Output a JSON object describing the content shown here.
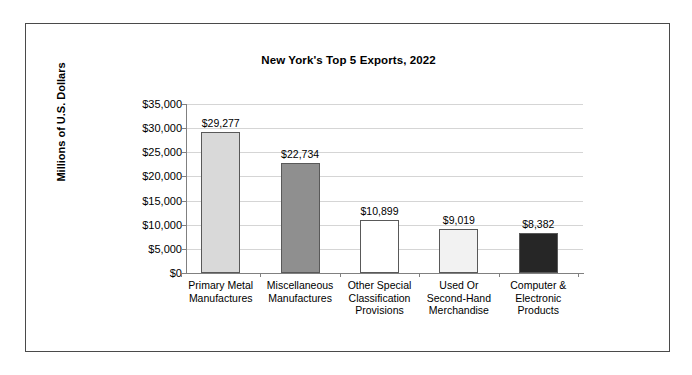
{
  "chart_data": {
    "type": "bar",
    "title": "New York's Top 5 Exports, 2022",
    "xlabel": "",
    "ylabel": "Millions of U.S. Dollars",
    "ylim": [
      0,
      35000
    ],
    "ytick_labels": [
      "$35,000",
      "$30,000",
      "$25,000",
      "$20,000",
      "$15,000",
      "$10,000",
      "$5,000",
      "$0"
    ],
    "ytick_values": [
      35000,
      30000,
      25000,
      20000,
      15000,
      10000,
      5000,
      0
    ],
    "grid": true,
    "legend": "none",
    "categories": [
      "Primary Metal Manufactures",
      "Miscellaneous Manufactures",
      "Other Special Classification Provisions",
      "Used Or Second-Hand Merchandise",
      "Computer & Electronic Products"
    ],
    "category_lines": [
      [
        "Primary Metal",
        "Manufactures"
      ],
      [
        "Miscellaneous",
        "Manufactures"
      ],
      [
        "Other Special",
        "Classification",
        "Provisions"
      ],
      [
        "Used Or",
        "Second-Hand",
        "Merchandise"
      ],
      [
        "Computer &",
        "Electronic",
        "Products"
      ]
    ],
    "values": [
      29277,
      22734,
      10899,
      9019,
      8382
    ],
    "value_labels": [
      "$29,277",
      "$22,734",
      "$10,899",
      "$9,019",
      "$8,382"
    ],
    "bar_colors": [
      "#d9d9d9",
      "#8f8f8f",
      "#ffffff",
      "#f2f2f2",
      "#262626"
    ],
    "bar_border_color": "#595959"
  },
  "frame": {
    "border_color": "#4a4a4a"
  }
}
